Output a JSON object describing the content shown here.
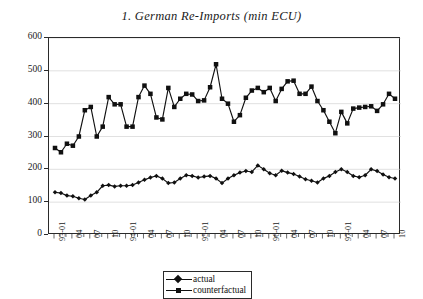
{
  "chart_data": {
    "type": "line",
    "title": "1. German Re-Imports (min ECU)",
    "xlabel": "",
    "ylabel": "",
    "ylim": [
      0,
      600
    ],
    "ytick_values": [
      0,
      100,
      200,
      300,
      400,
      500,
      600
    ],
    "ytick_labels": [
      "0",
      "100",
      "200",
      "300",
      "400",
      "500",
      "600"
    ],
    "grid": true,
    "grid_axis": "y",
    "legend_position": "below-center",
    "x": [
      "93-01",
      "93-02",
      "93-03",
      "93-04",
      "93-05",
      "93-06",
      "93-07",
      "93-08",
      "93-09",
      "93-10",
      "93-11",
      "93-12",
      "94-01",
      "94-02",
      "94-03",
      "94-04",
      "94-05",
      "94-06",
      "94-07",
      "94-08",
      "94-09",
      "94-10",
      "94-11",
      "94-12",
      "95-01",
      "95-02",
      "95-03",
      "95-04",
      "95-05",
      "95-06",
      "95-07",
      "95-08",
      "95-09",
      "95-10",
      "95-11",
      "95-12",
      "96-01",
      "96-02",
      "96-03",
      "96-04",
      "96-05",
      "96-06",
      "96-07",
      "96-08",
      "96-09",
      "96-10",
      "96-11",
      "96-12",
      "97-01",
      "97-02",
      "97-03",
      "97-04",
      "97-05",
      "97-06",
      "97-07",
      "97-08",
      "97-09",
      "97-10"
    ],
    "xtick_labels": [
      {
        "index": 0,
        "label": "93-01",
        "major": true
      },
      {
        "index": 3,
        "label": "04",
        "major": false
      },
      {
        "index": 6,
        "label": "07",
        "major": false
      },
      {
        "index": 9,
        "label": "10",
        "major": false
      },
      {
        "index": 12,
        "label": "94-01",
        "major": true
      },
      {
        "index": 15,
        "label": "04",
        "major": false
      },
      {
        "index": 18,
        "label": "07",
        "major": false
      },
      {
        "index": 21,
        "label": "10",
        "major": false
      },
      {
        "index": 24,
        "label": "95-01",
        "major": true
      },
      {
        "index": 27,
        "label": "04",
        "major": false
      },
      {
        "index": 30,
        "label": "07",
        "major": false
      },
      {
        "index": 33,
        "label": "10",
        "major": false
      },
      {
        "index": 36,
        "label": "96-01",
        "major": true
      },
      {
        "index": 39,
        "label": "04",
        "major": false
      },
      {
        "index": 42,
        "label": "07",
        "major": false
      },
      {
        "index": 45,
        "label": "10",
        "major": false
      },
      {
        "index": 48,
        "label": "97-01",
        "major": true
      },
      {
        "index": 51,
        "label": "04",
        "major": false
      },
      {
        "index": 54,
        "label": "07",
        "major": false
      },
      {
        "index": 57,
        "label": "10",
        "major": false
      }
    ],
    "series": [
      {
        "name": "actual",
        "marker": "diamond",
        "color": "#101010",
        "values": [
          130,
          128,
          120,
          118,
          112,
          108,
          120,
          130,
          150,
          152,
          148,
          150,
          150,
          152,
          160,
          168,
          175,
          180,
          172,
          158,
          160,
          172,
          182,
          180,
          175,
          178,
          180,
          172,
          158,
          172,
          182,
          190,
          195,
          192,
          212,
          200,
          188,
          182,
          196,
          190,
          186,
          178,
          170,
          165,
          160,
          172,
          180,
          192,
          200,
          192,
          180,
          176,
          182,
          200,
          195,
          184,
          176,
          172
        ]
      },
      {
        "name": "counterfactual",
        "marker": "square",
        "color": "#101010",
        "values": [
          265,
          252,
          278,
          272,
          300,
          380,
          390,
          300,
          330,
          420,
          398,
          398,
          330,
          330,
          420,
          455,
          430,
          358,
          352,
          448,
          390,
          415,
          430,
          428,
          408,
          410,
          450,
          520,
          415,
          400,
          345,
          365,
          418,
          440,
          448,
          435,
          448,
          408,
          445,
          468,
          470,
          430,
          430,
          452,
          408,
          380,
          345,
          310,
          375,
          340,
          385,
          388,
          390,
          392,
          378,
          398,
          430,
          415
        ]
      }
    ]
  },
  "legend": {
    "items": [
      {
        "label": "actual",
        "marker": "diamond"
      },
      {
        "label": "counterfactual",
        "marker": "square"
      }
    ]
  }
}
